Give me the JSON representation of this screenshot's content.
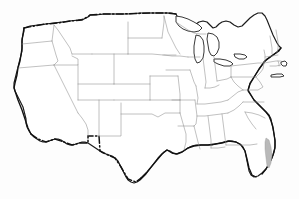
{
  "figure": {
    "title": "Outline map of the contiguous United States",
    "background_color": "#fdfdfd",
    "width": 299,
    "height": 199
  },
  "style": {
    "national_outline_color": "#1a1a1a",
    "state_border_color": "#8d8d8d",
    "international_border_color": "#111111",
    "lake_fill_color": "#ffffff",
    "shaded_region_color": "#b9b9b9",
    "national_outline_width": "1.15",
    "state_border_width": "0.55",
    "international_border_dash": "7 2.4 1.4 2.4"
  },
  "features": {
    "national_outline_label": "contiguous-united-states-outline",
    "canada_border_label": "united-states-canada-border",
    "mexico_border_label": "united-states-mexico-border",
    "great_lakes_label": "great-lakes",
    "state_borders_label": "state-boundaries",
    "florida_shaded_label": "florida-shaded-area",
    "long_island_label": "long-island",
    "cape_cod_label": "cape-cod"
  },
  "regions": [
    "Pacific Northwest",
    "California and Great Basin",
    "Southwest",
    "Rocky Mountains",
    "Great Plains",
    "Midwest and Great Lakes",
    "Northeast and New England",
    "Mid-Atlantic",
    "Southeast",
    "Gulf Coast and Texas"
  ]
}
